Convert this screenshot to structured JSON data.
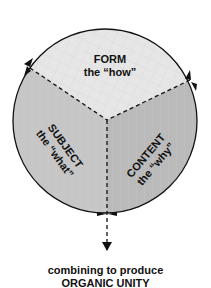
{
  "diagram": {
    "faces": {
      "top": {
        "title": "FORM",
        "subtitle": "the “how”"
      },
      "left": {
        "title": "SUBJECT",
        "subtitle": "the “what”"
      },
      "right": {
        "title": "CONTENT",
        "subtitle": "the “why”"
      }
    },
    "caption": {
      "line1": "combining to produce",
      "line2": "ORGANIC UNITY"
    },
    "colors": {
      "top_face": "#e6e6e6",
      "left_face": "#c4c4c4",
      "right_face": "#b9b9b9",
      "outline": "#111111"
    }
  }
}
